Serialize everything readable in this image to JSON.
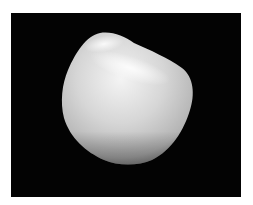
{
  "image": {
    "subject": "tumbled white stone",
    "background_color": "#030303",
    "border_color": "#ffffff",
    "stone_colors": {
      "highlight": "#f4f4f4",
      "mid": "#c9c9c9",
      "shadow": "#8e8e8e"
    }
  }
}
